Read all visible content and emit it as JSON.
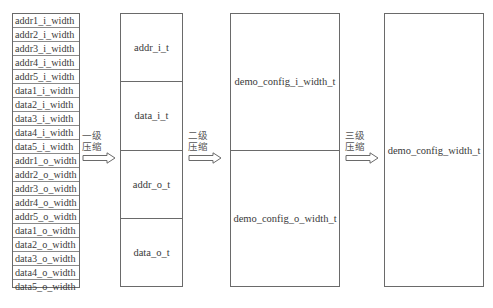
{
  "diagram": {
    "input_fields": [
      "addr1_i_width",
      "addr2_i_width",
      "addr3_i_width",
      "addr4_i_width",
      "addr5_i_width",
      "data1_i_width",
      "data2_i_width",
      "data3_i_width",
      "data4_i_width",
      "data5_i_width",
      "addr1_o_width",
      "addr2_o_width",
      "addr3_o_width",
      "addr4_o_width",
      "addr5_o_width",
      "data1_o_width",
      "data2_o_width",
      "data3_o_width",
      "data4_o_width",
      "data5_o_width"
    ],
    "level1": {
      "arrow_label_line1": "一级",
      "arrow_label_line2": "压缩",
      "types": [
        "addr_i_t",
        "data_i_t",
        "addr_o_t",
        "data_o_t"
      ]
    },
    "level2": {
      "arrow_label_line1": "二级",
      "arrow_label_line2": "压缩",
      "types": [
        "demo_config_i_width_t",
        "demo_config_o_width_t"
      ]
    },
    "level3": {
      "arrow_label_line1": "三级",
      "arrow_label_line2": "压缩",
      "types": [
        "demo_config_width_t"
      ]
    },
    "colors": {
      "border": "#6a6a6a",
      "text": "#3a3a3a",
      "background": "#ffffff"
    }
  }
}
